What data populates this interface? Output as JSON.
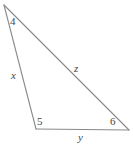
{
  "figure": {
    "type": "triangle-diagram",
    "background_color": "#ffffff",
    "stroke_color": "#8a8a8a",
    "label_color": "#454545",
    "width": 133,
    "height": 146
  },
  "vertices": {
    "top": {
      "name": "top-vertex",
      "x": 4,
      "y": 5
    },
    "bottom_left": {
      "name": "bottom-left-vertex",
      "x": 36,
      "y": 129
    },
    "bottom_right": {
      "name": "bottom-right-vertex",
      "x": 129,
      "y": 130
    }
  },
  "angle_labels": [
    {
      "id": "angle-4",
      "text": "4",
      "vertex": "top"
    },
    {
      "id": "angle-5",
      "text": "5",
      "vertex": "bottom_left"
    },
    {
      "id": "angle-6",
      "text": "6",
      "vertex": "bottom_right"
    }
  ],
  "side_labels": [
    {
      "id": "side-x",
      "text": "x",
      "side": "left-side"
    },
    {
      "id": "side-z",
      "text": "z",
      "side": "right-side"
    },
    {
      "id": "side-y",
      "text": "y",
      "side": "bottom-side"
    }
  ],
  "sides": [
    {
      "id": "left-side",
      "from": "top",
      "to": "bottom_left",
      "label": "x"
    },
    {
      "id": "right-side",
      "from": "top",
      "to": "bottom_right",
      "label": "z"
    },
    {
      "id": "bottom-side",
      "from": "bottom_left",
      "to": "bottom_right",
      "label": "y"
    }
  ]
}
